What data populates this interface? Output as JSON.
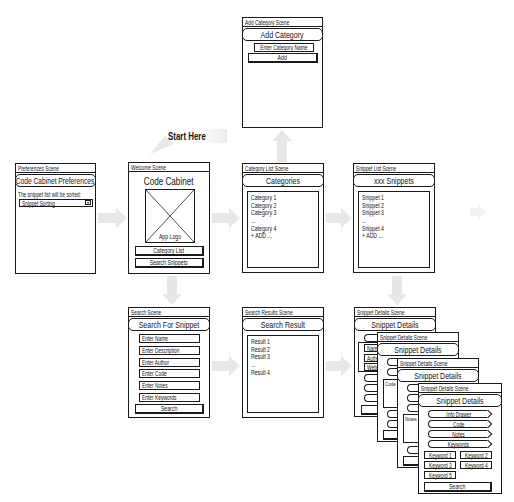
{
  "start_here": "Start Here",
  "icons": {
    "dropdown": "▼",
    "image_placeholder": "crossed-box"
  },
  "colors": {
    "line": "#1a1a1a",
    "arrow": "#e7e7e7",
    "background": "#ffffff"
  },
  "scenes": {
    "add_category": {
      "header": "Add Category Scene",
      "title": "Add Category",
      "input_placeholder": "Enter Category Name",
      "button": "Add"
    },
    "preferences": {
      "header": "Preferences Scene",
      "title": "Code Cabinet Preferences",
      "description": "The snippet list will be sorted:",
      "dropdown_value": "Snippet Sorting"
    },
    "welcome": {
      "header": "Welcome Scene",
      "title": "Code Cabinet",
      "logo_label": "App Logo",
      "buttons": [
        "Category List",
        "Search Snippets"
      ]
    },
    "category_list": {
      "header": "Category List Scene",
      "title": "Categories",
      "items": [
        "Category 1",
        "Category 2",
        "Category 3",
        "...",
        "Category 4",
        "+ ADD ..."
      ]
    },
    "snippet_list": {
      "header": "Snippet List Scene",
      "title": "xxx Snippets",
      "items": [
        "Snippet 1",
        "Snippet 2",
        "Snippet 3",
        "...",
        "Snippet 4",
        "+ ADD ..."
      ]
    },
    "search": {
      "header": "Search Scene",
      "title": "Search For Snippet",
      "fields": [
        "Enter Name",
        "Enter Description",
        "Enter Author",
        "Enter Code",
        "Enter Notes",
        "Enter Keywords"
      ],
      "button": "Search"
    },
    "search_results": {
      "header": "Search Results Scene",
      "title": "Search Result",
      "items": [
        "Result 1",
        "Result 2",
        "Result 3",
        "...",
        "Result 4"
      ]
    },
    "snippet_details": {
      "header": "Snippet Details Scene",
      "title": "Snippet Details",
      "tabs": [
        "Info Drawer",
        "Code",
        "Notes",
        "Keywords"
      ],
      "info_fields": [
        "Name",
        "Author",
        "Website"
      ],
      "code_panel_label": "Code",
      "notes_panel_label": "Notes",
      "keywords": [
        "Keyword 1",
        "Keyword 2",
        "Keyword 3",
        "Keyword 4",
        "Keyword 5"
      ],
      "button": "Search"
    }
  }
}
